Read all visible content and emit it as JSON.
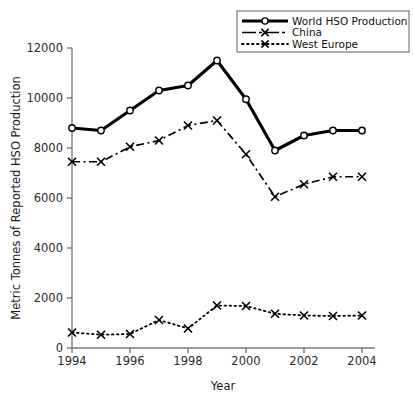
{
  "chart_data": {
    "type": "line",
    "title": "",
    "xlabel": "Year",
    "ylabel": "Metric Tonnes of Reported HSO Production",
    "x": [
      1994,
      1995,
      1996,
      1997,
      1998,
      1999,
      2000,
      2001,
      2002,
      2003,
      2004
    ],
    "xlim": [
      1994,
      2004
    ],
    "ylim": [
      0,
      12000
    ],
    "xtick_labels": [
      "1994",
      "1996",
      "1998",
      "2000",
      "2002",
      "2004"
    ],
    "xtick_values": [
      1994,
      1996,
      1998,
      2000,
      2002,
      2004
    ],
    "ytick_labels": [
      "0",
      "2000",
      "4000",
      "6000",
      "8000",
      "10000",
      "12000"
    ],
    "ytick_values": [
      0,
      2000,
      4000,
      6000,
      8000,
      10000,
      12000
    ],
    "grid": false,
    "legend_position": "top-right",
    "series": [
      {
        "name": "World HSO Production",
        "marker": "circle",
        "linestyle": "solid",
        "color": "#000000",
        "values": [
          8800,
          8700,
          9500,
          10300,
          10500,
          11500,
          9950,
          7900,
          8500,
          8700,
          8700
        ]
      },
      {
        "name": "China",
        "marker": "x",
        "linestyle": "dash-dot",
        "color": "#000000",
        "values": [
          7450,
          7450,
          8050,
          8300,
          8900,
          9100,
          7750,
          6050,
          6550,
          6850,
          6850
        ]
      },
      {
        "name": "West Europe",
        "marker": "x",
        "linestyle": "dotted",
        "color": "#000000",
        "values": [
          620,
          530,
          560,
          1120,
          780,
          1700,
          1680,
          1370,
          1300,
          1280,
          1300
        ]
      }
    ]
  },
  "axes": {
    "x_title": "Year",
    "y_title": "Metric Tonnes of Reported HSO Production"
  },
  "legend": {
    "entries": [
      {
        "label": "World HSO Production",
        "icon": "solid-line-circle-marker-icon"
      },
      {
        "label": "China",
        "icon": "dash-dot-line-x-marker-icon"
      },
      {
        "label": "West Europe",
        "icon": "dotted-line-x-marker-icon"
      }
    ]
  }
}
